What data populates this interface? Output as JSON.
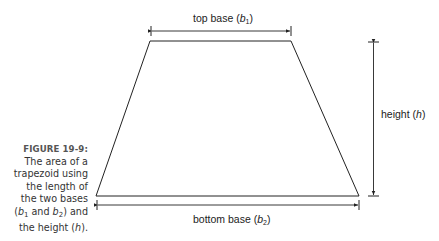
{
  "figure": {
    "number_label": "FIGURE 19-9:",
    "caption_lines": [
      "The area of a",
      "trapezoid using",
      "the length of",
      "the two bases"
    ],
    "caption_b1": "b",
    "caption_b1_sub": "1",
    "caption_and": " and ",
    "caption_b2": "b",
    "caption_b2_sub": "2",
    "caption_after": ") and",
    "caption_last_prefix": "the height (",
    "caption_h": "h",
    "caption_last_suffix": ")."
  },
  "diagram": {
    "shape": "trapezoid",
    "top_label_text": "top base (",
    "top_label_var": "b",
    "top_label_sub": "1",
    "top_label_close": ")",
    "bottom_label_text": "bottom base (",
    "bottom_label_var": "b",
    "bottom_label_sub": "2",
    "bottom_label_close": ")",
    "height_label_text": "height (",
    "height_label_var": "h",
    "height_label_close": ")",
    "line_color": "#222222",
    "vertices": {
      "top_left": [
        150,
        41
      ],
      "top_right": [
        291,
        41
      ],
      "bottom_right": [
        359,
        196
      ],
      "bottom_left": [
        96,
        196
      ]
    }
  }
}
